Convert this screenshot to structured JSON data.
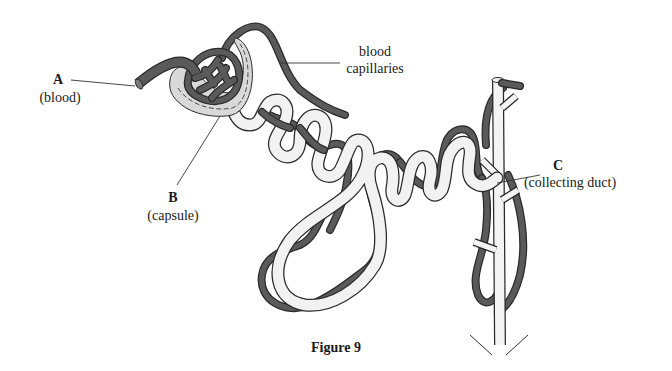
{
  "figure": {
    "caption": "Figure 9"
  },
  "labels": {
    "a": {
      "letter": "A",
      "text": "(blood)"
    },
    "b": {
      "letter": "B",
      "text": "(capsule)"
    },
    "c": {
      "letter": "C",
      "text": "(collecting duct)"
    },
    "capillaries": {
      "line1": "blood",
      "line2": "capillaries"
    }
  },
  "colors": {
    "vessel": "#5a5a5a",
    "tubule_fill": "#f2f2f2",
    "outline": "#2a2a2a",
    "capsule_fill": "#d9d9d9",
    "leader": "#333333"
  }
}
